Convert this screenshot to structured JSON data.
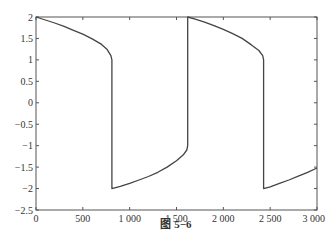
{
  "caption": "图 5−6",
  "chart_data": {
    "type": "line",
    "title": "",
    "xlabel": "",
    "ylabel": "",
    "xlim": [
      0,
      3000
    ],
    "ylim": [
      -2.5,
      2
    ],
    "grid": false,
    "legend": null,
    "x_ticks": [
      0,
      500,
      1000,
      1500,
      2000,
      2500,
      3000
    ],
    "x_tick_labels": [
      "0",
      "500",
      "1 000",
      "1 500",
      "2 000",
      "2 500",
      "3 000"
    ],
    "y_ticks": [
      2,
      1.5,
      1,
      0.5,
      0,
      -0.5,
      -1,
      -1.5,
      -2,
      -2.5
    ],
    "y_tick_labels": [
      "2",
      "1.5",
      "1",
      "0.5",
      "0",
      "−0.5",
      "−1",
      "−1.5",
      "−2",
      "−2.5"
    ],
    "series": [
      {
        "name": "relaxation oscillation",
        "color": "#444444",
        "x": [
          0,
          100,
          200,
          300,
          400,
          500,
          600,
          700,
          760,
          800,
          810,
          810,
          900,
          1000,
          1100,
          1200,
          1300,
          1400,
          1500,
          1570,
          1610,
          1620,
          1620,
          1700,
          1800,
          1900,
          2000,
          2100,
          2200,
          2300,
          2380,
          2420,
          2430,
          2430,
          2500,
          2600,
          2700,
          2800,
          2900,
          3000
        ],
        "y": [
          2.0,
          1.93,
          1.86,
          1.78,
          1.69,
          1.6,
          1.49,
          1.36,
          1.24,
          1.1,
          1.0,
          -2.0,
          -1.95,
          -1.88,
          -1.8,
          -1.72,
          -1.62,
          -1.5,
          -1.35,
          -1.22,
          -1.1,
          -1.0,
          2.0,
          1.95,
          1.88,
          1.8,
          1.71,
          1.61,
          1.5,
          1.35,
          1.22,
          1.1,
          1.0,
          -2.0,
          -1.96,
          -1.88,
          -1.8,
          -1.71,
          -1.62,
          -1.52
        ]
      }
    ]
  }
}
